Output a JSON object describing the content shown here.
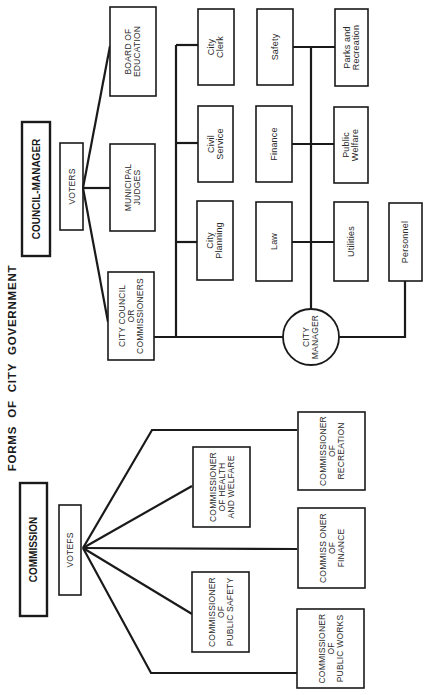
{
  "title": "FORMS OF CITY GOVERNMENT",
  "council_manager": {
    "header": "COUNCIL-MANAGER",
    "voters": "VOTERS",
    "elected": [
      {
        "id": "board-of-education",
        "lines": [
          "BOARD OF",
          "EDUCATION"
        ]
      },
      {
        "id": "municipal-judges",
        "lines": [
          "MUNICIPAL",
          "JUDGES"
        ]
      },
      {
        "id": "city-council",
        "lines": [
          "CITY COUNCIL",
          "OR",
          "COMMISSIONERS"
        ]
      }
    ],
    "city_manager": [
      "CITY",
      "MANAGER"
    ],
    "departments": [
      {
        "id": "city-clerk",
        "lines": [
          "City",
          "Clerk"
        ]
      },
      {
        "id": "civil-service",
        "lines": [
          "Civil",
          "Service"
        ]
      },
      {
        "id": "city-planning",
        "lines": [
          "City",
          "Planning"
        ]
      },
      {
        "id": "safety",
        "lines": [
          "Safety"
        ]
      },
      {
        "id": "finance",
        "lines": [
          "Finance"
        ]
      },
      {
        "id": "law",
        "lines": [
          "Law"
        ]
      },
      {
        "id": "parks-and-recreation",
        "lines": [
          "Parks and",
          "Recreation"
        ]
      },
      {
        "id": "public-welfare",
        "lines": [
          "Public",
          "Welfare"
        ]
      },
      {
        "id": "utilities",
        "lines": [
          "Utilities"
        ]
      },
      {
        "id": "personnel",
        "lines": [
          "Personnel"
        ]
      }
    ]
  },
  "commission": {
    "header": "COMMISSION",
    "voters": "VOTEFS",
    "commissioners": [
      {
        "id": "health-and-welfare",
        "lines": [
          "COMMISSIONER",
          "OF HEALTH",
          "AND WELFARE"
        ]
      },
      {
        "id": "public-safety",
        "lines": [
          "COMMISSIONER",
          "OF",
          "PUBLIC SAFETY"
        ]
      },
      {
        "id": "recreation",
        "lines": [
          "COMMISSIONER",
          "OF",
          "RECREATION"
        ]
      },
      {
        "id": "finance",
        "lines": [
          "COMMISS ONER",
          "OF",
          "FINANCE"
        ]
      },
      {
        "id": "public-works",
        "lines": [
          "COMMISSIONER",
          "OF",
          "PUBLIC WORKS"
        ]
      }
    ]
  },
  "colors": {
    "ink": "#1a1a1a",
    "paper": "#ffffff"
  }
}
